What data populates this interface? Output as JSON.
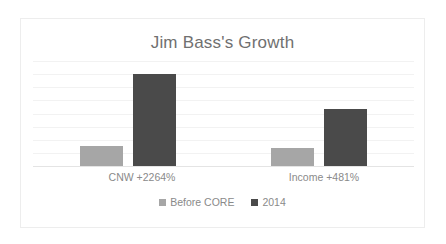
{
  "chart_data": {
    "type": "bar",
    "title": "Jim Bass's Growth",
    "xlabel": "",
    "ylabel": "",
    "grid": true,
    "gridlines": 8,
    "legend_position": "bottom",
    "ylim": [
      0,
      110
    ],
    "categories": [
      "CNW +2264%",
      "Income +481%"
    ],
    "series": [
      {
        "name": "Before CORE",
        "color": "#a6a6a6",
        "values": [
          21,
          19
        ]
      },
      {
        "name": "2014",
        "color": "#4a4a4a",
        "values": [
          96,
          60
        ]
      }
    ]
  },
  "legend": {
    "items": [
      {
        "label": "Before CORE",
        "color": "#a6a6a6"
      },
      {
        "label": "2014",
        "color": "#4a4a4a"
      }
    ]
  },
  "colors": {
    "before_core": "#a6a6a6",
    "year_2014": "#4a4a4a",
    "title_text": "#707070",
    "label_text": "#8a8a8a",
    "gridline": "#f2f2f2",
    "frame_border": "#ededed",
    "background": "#ffffff"
  }
}
